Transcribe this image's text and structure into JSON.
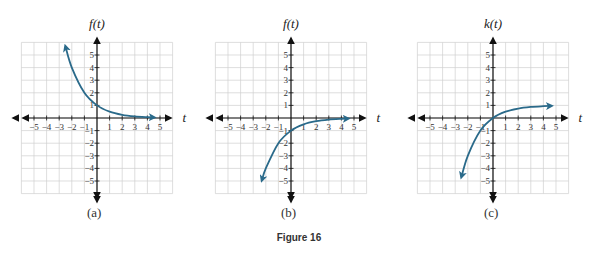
{
  "figure": {
    "caption": "Figure 16"
  },
  "chart_data": [
    {
      "type": "line",
      "panel_label": "(a)",
      "ylabel": "f(t)",
      "xlabel": "t",
      "xlim": [
        -6,
        6
      ],
      "ylim": [
        -6,
        6
      ],
      "x_ticks": [
        -5,
        -4,
        -3,
        -2,
        -1,
        1,
        2,
        3,
        4,
        5
      ],
      "y_ticks": [
        -5,
        -4,
        -3,
        -2,
        -1,
        1,
        2,
        3,
        4,
        5
      ],
      "grid": true,
      "series": [
        {
          "name": "f(t)",
          "color": "#2a6a8a",
          "x": [
            -2.5,
            -2,
            -1,
            0,
            1,
            2,
            3,
            4,
            4.5
          ],
          "y": [
            5.66,
            4,
            2,
            1,
            0.5,
            0.25,
            0.125,
            0.0625,
            0.044
          ]
        }
      ]
    },
    {
      "type": "line",
      "panel_label": "(b)",
      "ylabel": "f(t)",
      "xlabel": "t",
      "xlim": [
        -6,
        6
      ],
      "ylim": [
        -6,
        6
      ],
      "x_ticks": [
        -5,
        -4,
        -3,
        -2,
        -1,
        1,
        2,
        3,
        4,
        5
      ],
      "y_ticks": [
        -5,
        -4,
        -3,
        -2,
        -1,
        1,
        2,
        3,
        4,
        5
      ],
      "grid": true,
      "series": [
        {
          "name": "f(t)",
          "color": "#2a6a8a",
          "x": [
            -2.3,
            -2,
            -1,
            0,
            1,
            2,
            3,
            4,
            4.5
          ],
          "y": [
            -4.92,
            -4,
            -2,
            -1,
            -0.5,
            -0.25,
            -0.125,
            -0.0625,
            -0.044
          ]
        }
      ]
    },
    {
      "type": "line",
      "panel_label": "(c)",
      "ylabel": "k(t)",
      "xlabel": "t",
      "xlim": [
        -6,
        6
      ],
      "ylim": [
        -6,
        6
      ],
      "x_ticks": [
        -5,
        -4,
        -3,
        -2,
        -1,
        1,
        2,
        3,
        4,
        5
      ],
      "y_ticks": [
        -5,
        -4,
        -3,
        -2,
        -1,
        1,
        2,
        3,
        4,
        5
      ],
      "grid": true,
      "series": [
        {
          "name": "k(t)",
          "color": "#2a6a8a",
          "x": [
            -2.5,
            -2,
            -1,
            0,
            1,
            2,
            3,
            4,
            4.6
          ],
          "y": [
            -4.66,
            -3,
            -1,
            0,
            0.5,
            0.75,
            0.875,
            0.9375,
            0.96
          ]
        }
      ]
    }
  ],
  "layout": {
    "panels": [
      {
        "origin_x": 97,
        "origin_y": 118
      },
      {
        "origin_x": 291,
        "origin_y": 118
      },
      {
        "origin_x": 493,
        "origin_y": 118
      }
    ],
    "unit_px": 12.6,
    "axis_color": "#111111",
    "grid_color": "#d0d0d0",
    "curve_color": "#2a6a8a"
  }
}
